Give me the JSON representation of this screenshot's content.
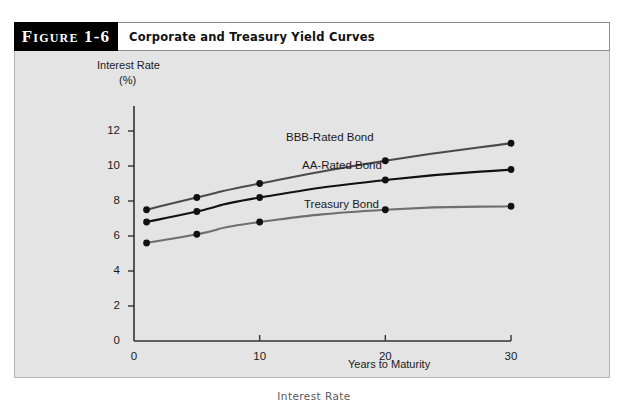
{
  "figure": {
    "number_label": "Figure 1-6",
    "title": "Corporate and Treasury Yield Curves",
    "bottom_caption": "Interest Rate"
  },
  "colors": {
    "panel_background": "#e4e4e4",
    "axis": "#333333",
    "bbb_line": "#4a4a4a",
    "aa_line": "#111111",
    "treasury_line": "#6e6e6e",
    "marker": "#111111",
    "header_box": "#000000"
  },
  "chart_data": {
    "type": "line",
    "title": "Corporate and Treasury Yield Curves",
    "xlabel": "Years to Maturity",
    "ylabel": "Interest Rate (%)",
    "ylabel_line1": "Interest Rate",
    "ylabel_line2": "(%)",
    "xlim": [
      0,
      32
    ],
    "ylim": [
      0,
      13
    ],
    "xticks": [
      0,
      10,
      20,
      30
    ],
    "xtick_labels": [
      "0",
      "10",
      "20",
      "30"
    ],
    "yticks": [
      0,
      2,
      4,
      6,
      8,
      10,
      12
    ],
    "ytick_labels": [
      "0",
      "2",
      "4",
      "6",
      "8",
      "10",
      "12"
    ],
    "grid": false,
    "legend_position": "inline-right-of-curves",
    "x": [
      1,
      5,
      10,
      20,
      30
    ],
    "series": [
      {
        "name": "BBB-Rated Bond",
        "color": "#4a4a4a",
        "values": [
          7.5,
          8.2,
          9.0,
          10.3,
          11.3
        ]
      },
      {
        "name": "AA-Rated Bond",
        "color": "#111111",
        "values": [
          6.8,
          7.4,
          8.2,
          9.2,
          9.8
        ]
      },
      {
        "name": "Treasury Bond",
        "color": "#6e6e6e",
        "values": [
          5.6,
          6.1,
          6.8,
          7.5,
          7.7
        ]
      }
    ]
  }
}
